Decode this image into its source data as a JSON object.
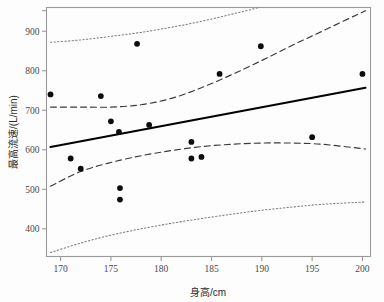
{
  "chart_data": {
    "type": "scatter",
    "title": "",
    "xlabel": "身高/cm",
    "ylabel": "最高流速/(L/min)",
    "xlim": [
      168.6,
      200.8
    ],
    "ylim": [
      330,
      960
    ],
    "xticks": [
      170,
      175,
      180,
      185,
      190,
      195,
      200
    ],
    "xtick_labels": [
      "170",
      "175",
      "180",
      "185",
      "190",
      "195",
      "200"
    ],
    "yticks": [
      400,
      500,
      600,
      700,
      800,
      900
    ],
    "ytick_labels": [
      "400",
      "500",
      "600",
      "700",
      "800",
      "900"
    ],
    "grid": false,
    "legend": "none",
    "points": [
      {
        "x": 169.0,
        "y": 740
      },
      {
        "x": 171.0,
        "y": 578
      },
      {
        "x": 172.0,
        "y": 552
      },
      {
        "x": 174.0,
        "y": 736
      },
      {
        "x": 175.0,
        "y": 672
      },
      {
        "x": 175.8,
        "y": 645
      },
      {
        "x": 175.9,
        "y": 503
      },
      {
        "x": 175.9,
        "y": 474
      },
      {
        "x": 177.6,
        "y": 868
      },
      {
        "x": 178.8,
        "y": 663
      },
      {
        "x": 183.0,
        "y": 620
      },
      {
        "x": 183.0,
        "y": 578
      },
      {
        "x": 184.0,
        "y": 582
      },
      {
        "x": 185.8,
        "y": 792
      },
      {
        "x": 189.9,
        "y": 862
      },
      {
        "x": 195.0,
        "y": 632
      },
      {
        "x": 200.0,
        "y": 792
      }
    ],
    "series": [
      {
        "name": "regression-line",
        "style": "solid",
        "x": [
          169.0,
          200.3
        ],
        "y": [
          607,
          757
        ]
      },
      {
        "name": "confidence-band-upper",
        "style": "dashed",
        "x": [
          169.0,
          172.0,
          175.0,
          178.0,
          181.0,
          184.0,
          187.0,
          190.0,
          193.0,
          196.0,
          200.3
        ],
        "y": [
          708,
          708,
          708,
          714,
          730,
          757,
          790,
          826,
          864,
          900,
          952
        ]
      },
      {
        "name": "confidence-band-lower",
        "style": "dashed",
        "x": [
          169.0,
          172.0,
          175.0,
          178.0,
          181.0,
          184.0,
          187.0,
          190.0,
          193.0,
          196.0,
          200.3
        ],
        "y": [
          508,
          545,
          568,
          585,
          598,
          608,
          614,
          617,
          617,
          614,
          602
        ]
      },
      {
        "name": "prediction-band-upper",
        "style": "dotted",
        "x": [
          169.0,
          172.0,
          175.0,
          178.0,
          181.0,
          184.0,
          187.0,
          190.0,
          193.0,
          196.0,
          200.3
        ],
        "y": [
          872,
          878,
          887,
          897,
          910,
          925,
          943,
          962,
          985,
          1010,
          1048
        ]
      },
      {
        "name": "prediction-band-lower",
        "style": "dotted",
        "x": [
          169.0,
          172.0,
          175.0,
          178.0,
          181.0,
          184.0,
          187.0,
          190.0,
          193.0,
          196.0,
          200.3
        ],
        "y": [
          340,
          364,
          384,
          400,
          414,
          426,
          437,
          447,
          455,
          462,
          468
        ]
      }
    ]
  },
  "style": {
    "frame_color": "#9a9a9a",
    "point_color": "#0d0d0d",
    "line_color": "#000000",
    "band_color": "#3a3a3a",
    "dotted_color": "#7d7d7d",
    "background": "#fdfdfd"
  }
}
